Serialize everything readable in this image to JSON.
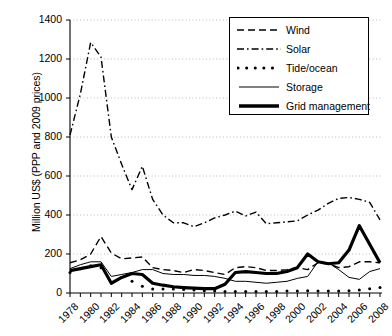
{
  "chart_data": {
    "type": "line",
    "title": "",
    "xlabel": "",
    "ylabel": "Million US$ (PPP and 2009 prices)",
    "ylim": [
      0,
      1400
    ],
    "ytick_step": 200,
    "yticks": [
      "0",
      "200",
      "400",
      "600",
      "800",
      "1000",
      "1200",
      "1400"
    ],
    "xlim": [
      1978,
      2008
    ],
    "xticks": [
      "1978",
      "1980",
      "1982",
      "1984",
      "1986",
      "1988",
      "1990",
      "1992",
      "1994",
      "1996",
      "1998",
      "2000",
      "2002",
      "2004",
      "2006",
      "2008"
    ],
    "xtick_minor_step": 1,
    "grid": "horizontal-dotted",
    "legend_position": "top-right",
    "x": [
      1978,
      1979,
      1980,
      1981,
      1982,
      1983,
      1984,
      1985,
      1986,
      1987,
      1988,
      1989,
      1990,
      1991,
      1992,
      1993,
      1994,
      1995,
      1996,
      1997,
      1998,
      1999,
      2000,
      2001,
      2002,
      2003,
      2004,
      2005,
      2006,
      2007,
      2008
    ],
    "series": [
      {
        "name": "Wind",
        "style": "dashed",
        "color": "#000000",
        "width": 1.4,
        "values": [
          155,
          170,
          200,
          290,
          205,
          175,
          180,
          185,
          130,
          120,
          115,
          105,
          120,
          115,
          105,
          95,
          130,
          135,
          130,
          115,
          115,
          120,
          130,
          120,
          155,
          150,
          130,
          135,
          160,
          160,
          155
        ]
      },
      {
        "name": "Solar",
        "style": "dashdot",
        "color": "#000000",
        "width": 1.4,
        "values": [
          810,
          1020,
          1285,
          1210,
          800,
          660,
          530,
          650,
          480,
          400,
          360,
          360,
          340,
          360,
          385,
          400,
          420,
          395,
          415,
          355,
          360,
          365,
          370,
          400,
          425,
          460,
          485,
          490,
          480,
          465,
          375
        ]
      },
      {
        "name": "Tide/ocean",
        "style": "dotted",
        "color": "#000000",
        "width": 3.0,
        "values": [
          105,
          125,
          140,
          130,
          null,
          null,
          60,
          35,
          20,
          20,
          20,
          18,
          15,
          12,
          10,
          8,
          8,
          8,
          8,
          8,
          8,
          10,
          10,
          12,
          10,
          10,
          10,
          12,
          15,
          22,
          28
        ]
      },
      {
        "name": "Storage",
        "style": "solid",
        "color": "#000000",
        "width": 1.0,
        "values": [
          125,
          145,
          160,
          160,
          85,
          95,
          105,
          120,
          120,
          100,
          95,
          95,
          90,
          90,
          85,
          75,
          60,
          60,
          55,
          50,
          55,
          60,
          75,
          85,
          160,
          155,
          120,
          80,
          70,
          110,
          125
        ]
      },
      {
        "name": "Grid management",
        "style": "solid",
        "color": "#000000",
        "width": 3.2,
        "values": [
          115,
          125,
          135,
          145,
          50,
          80,
          100,
          95,
          50,
          40,
          32,
          28,
          25,
          22,
          22,
          45,
          105,
          110,
          105,
          100,
          100,
          110,
          130,
          200,
          160,
          150,
          155,
          220,
          345,
          250,
          155
        ]
      }
    ]
  },
  "legend": {
    "items": [
      {
        "label": "Wind",
        "style": "dashed"
      },
      {
        "label": "Solar",
        "style": "dashdot"
      },
      {
        "label": "Tide/ocean",
        "style": "dotted"
      },
      {
        "label": "Storage",
        "style": "solid-thin"
      },
      {
        "label": "Grid management",
        "style": "solid-thick"
      }
    ]
  }
}
